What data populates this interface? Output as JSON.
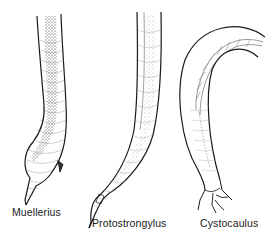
{
  "figure": {
    "specimens": [
      {
        "id": "muellerius",
        "label": "Muellerius"
      },
      {
        "id": "protostrongylus",
        "label": "Protostrongylus"
      },
      {
        "id": "cystocaulus",
        "label": "Cystocaulus"
      }
    ]
  },
  "colors": {
    "ink": "#1a1a1a",
    "background": "#ffffff"
  }
}
